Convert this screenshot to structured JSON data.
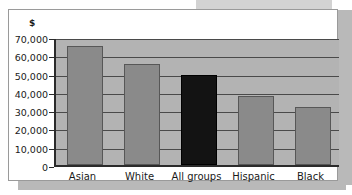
{
  "chart_data": {
    "type": "bar",
    "title": "",
    "subtitle": "",
    "xlabel": "",
    "ylabel": "$",
    "unit_label": "$",
    "categories": [
      "Asian",
      "White",
      "All groups",
      "Hispanic",
      "Black"
    ],
    "values": [
      65000,
      55000,
      49000,
      38000,
      31500
    ],
    "ylim": [
      0,
      70000
    ],
    "ytick_values": [
      0,
      10000,
      20000,
      30000,
      40000,
      50000,
      60000,
      70000
    ],
    "ytick_labels": [
      "0",
      "10,000",
      "20,000",
      "30,000",
      "40,000",
      "50,000",
      "60,000",
      "70,000"
    ],
    "grid": true,
    "legend": null,
    "legend_position": "none",
    "bar_colors": [
      "#8a8a8a",
      "#8a8a8a",
      "#131313",
      "#8a8a8a",
      "#8a8a8a"
    ],
    "highlight_category": "All groups",
    "plot_background": "#b3b3b3",
    "gridline_color": "#4a4a4a",
    "axis_color": "#2b2b2b",
    "page_background": "#ffffff"
  }
}
